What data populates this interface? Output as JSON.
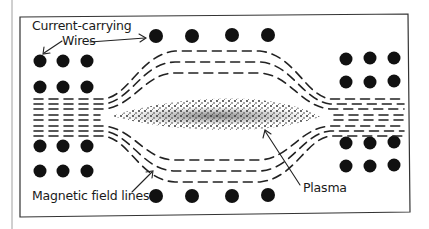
{
  "diagram": {
    "colors": {
      "ink": "#111111",
      "frame": "#333333",
      "background": "#ffffff",
      "margin_line": "#9a9a9a"
    },
    "labels": {
      "wires": "Current-carrying Wires",
      "wires_line1": "Current-carrying",
      "wires_line2": "Wires",
      "field_lines": "Magnetic field lines",
      "plasma": "Plasma"
    },
    "components": [
      {
        "id": "wires",
        "description": "Cross-sections of current-carrying wires (black dots)",
        "groups": [
          "top row (4)",
          "bottom row (4)",
          "left block 3x4",
          "right block 3x4"
        ]
      },
      {
        "id": "field_lines",
        "description": "Dashed magnetic field lines squeezing around plasma"
      },
      {
        "id": "plasma",
        "description": "Stippled lens-shaped plasma in center"
      }
    ]
  }
}
